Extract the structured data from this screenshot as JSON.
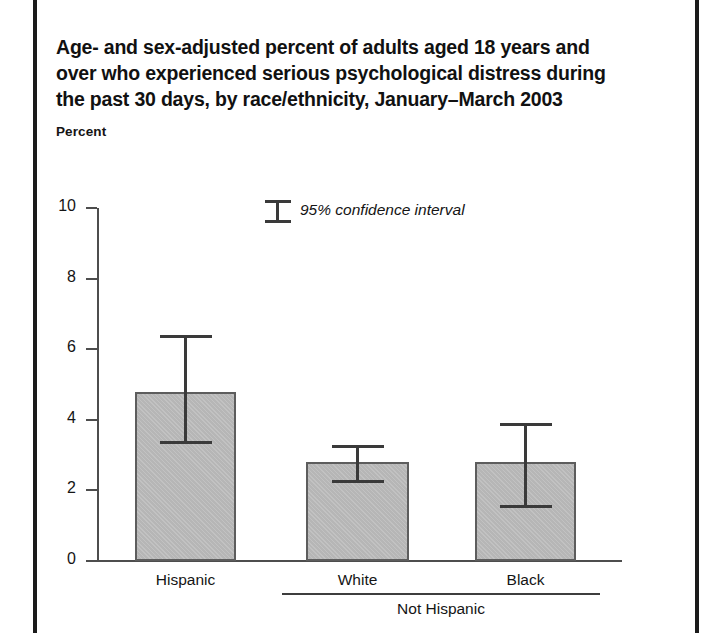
{
  "figure": {
    "title_lines": [
      "Age- and sex-adjusted percent of adults aged 18 years and",
      "over who experienced serious psychological distress during",
      "the past 30 days, by race/ethnicity, January–March 2003"
    ],
    "axis_caption": "Percent",
    "legend_label": "95% confidence interval",
    "legend_icon": "error-bar-icon",
    "group_bracket_label": "Not Hispanic"
  },
  "colors": {
    "bar_fill": "#b6b6b6",
    "bar_outline": "#5d5d5d",
    "axis": "#4d4d4d",
    "error_bar": "#3a3a3a",
    "text": "#141414",
    "page_rule": "#1b1b1b"
  },
  "chart_data": {
    "type": "bar",
    "title": "Age- and sex-adjusted percent of adults aged 18 years and over who experienced serious psychological distress during the past 30 days, by race/ethnicity, January–March 2003",
    "xlabel": "",
    "ylabel": "Percent",
    "ylim": [
      0,
      10
    ],
    "yticks": [
      0,
      2,
      4,
      6,
      8,
      10
    ],
    "ytick_labels": [
      "0",
      "2",
      "4",
      "6",
      "8",
      "10"
    ],
    "grid": false,
    "legend": [
      "95% confidence interval"
    ],
    "legend_position": "upper center",
    "categories": [
      "Hispanic",
      "White",
      "Black"
    ],
    "category_groups": [
      {
        "label": "",
        "members": [
          "Hispanic"
        ]
      },
      {
        "label": "Not Hispanic",
        "members": [
          "White",
          "Black"
        ]
      }
    ],
    "values": [
      4.8,
      2.8,
      2.8
    ],
    "error_low": [
      3.4,
      2.3,
      1.6
    ],
    "error_high": [
      6.4,
      3.3,
      3.9
    ],
    "series": [
      {
        "name": "Serious psychological distress",
        "values": [
          4.8,
          2.8,
          2.8
        ],
        "ci_low": [
          3.4,
          2.3,
          1.6
        ],
        "ci_high": [
          6.4,
          3.3,
          3.9
        ]
      }
    ]
  }
}
